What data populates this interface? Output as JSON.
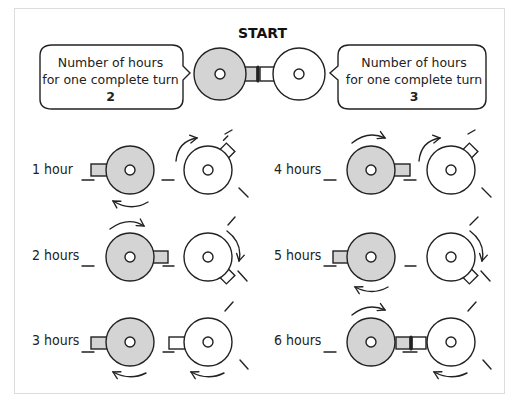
{
  "title": "START",
  "colors": {
    "gray_wheel": "#d4d4d4",
    "white_wheel": "#ffffff",
    "stroke": "#222222",
    "frame": "#dcdcdc"
  },
  "bubbles": [
    {
      "id": "left",
      "line1": "Number of hours",
      "line2": "for one complete turn",
      "value": "2"
    },
    {
      "id": "right",
      "line1": "Number of hours",
      "line2": "for one complete turn",
      "value": "3"
    }
  ],
  "panels": [
    {
      "label": "1 hour"
    },
    {
      "label": "2 hours"
    },
    {
      "label": "3 hours"
    },
    {
      "label": "4 hours"
    },
    {
      "label": "5 hours"
    },
    {
      "label": "6 hours"
    }
  ]
}
